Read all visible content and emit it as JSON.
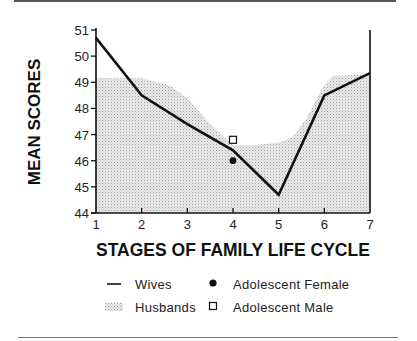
{
  "chart_data": {
    "type": "line",
    "title": "",
    "xlabel": "STAGES OF FAMILY LIFE CYCLE",
    "ylabel": "MEAN SCORES",
    "x": [
      1,
      2,
      3,
      4,
      5,
      6,
      7
    ],
    "x_ticks": [
      "1",
      "2",
      "3",
      "4",
      "5",
      "6",
      "7"
    ],
    "y_ticks": [
      "44",
      "45",
      "46",
      "47",
      "48",
      "49",
      "50",
      "51"
    ],
    "xlim": [
      1,
      7
    ],
    "ylim": [
      44,
      51
    ],
    "grid": false,
    "series": [
      {
        "name": "Wives",
        "style": "line",
        "values": [
          50.7,
          48.5,
          47.4,
          46.4,
          44.7,
          48.5,
          49.35
        ]
      },
      {
        "name": "Husbands",
        "style": "shaded-area",
        "x": [
          1,
          2,
          2.6,
          3,
          3.5,
          4,
          4.5,
          5,
          5.3,
          5.6,
          6,
          6.2,
          7
        ],
        "values": [
          49.15,
          49.15,
          48.9,
          48.4,
          47.4,
          46.6,
          46.6,
          46.7,
          46.9,
          47.6,
          48.9,
          49.25,
          49.3
        ]
      },
      {
        "name": "Adolescent Female",
        "style": "filled-circle",
        "points": [
          {
            "x": 4,
            "y": 46.0
          }
        ]
      },
      {
        "name": "Adolescent Male",
        "style": "open-square",
        "points": [
          {
            "x": 4,
            "y": 46.8
          }
        ]
      }
    ],
    "legend": {
      "placement": "bottom",
      "entries": [
        {
          "label": "Wives",
          "symbol": "line"
        },
        {
          "label": "Adolescent Female",
          "symbol": "filled-circle"
        },
        {
          "label": "Husbands",
          "symbol": "shaded-area"
        },
        {
          "label": "Adolescent Male",
          "symbol": "open-square"
        }
      ]
    }
  },
  "colors": {
    "line": "#111111",
    "area": "#d9d9d9",
    "dots": "#9a9a9a"
  }
}
